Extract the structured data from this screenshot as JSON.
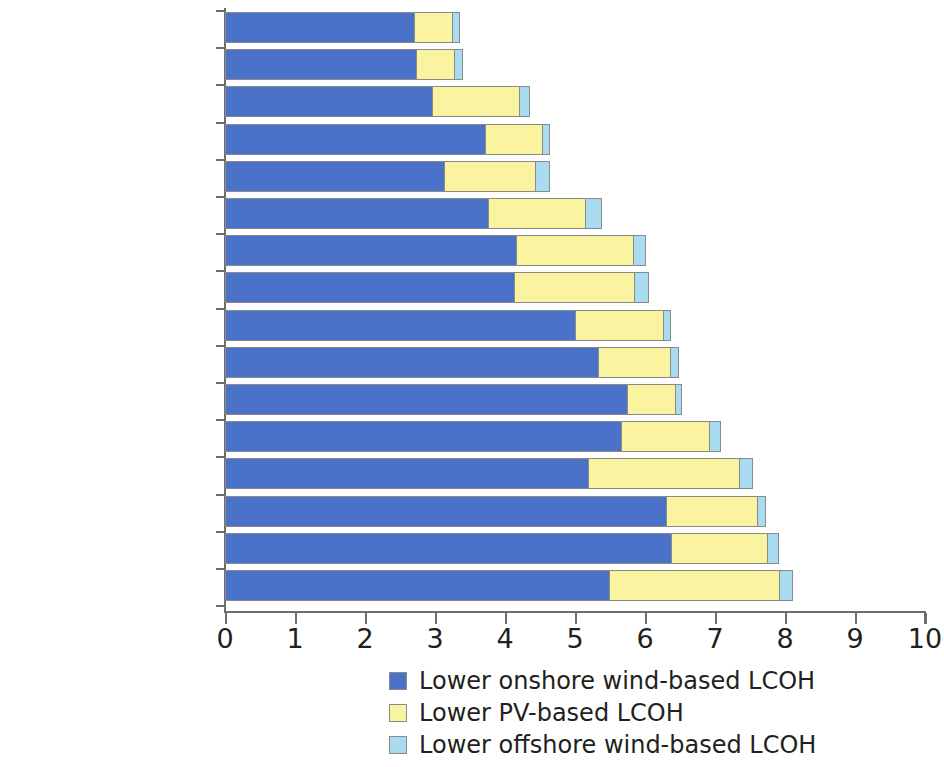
{
  "chart_data": {
    "type": "bar",
    "orientation": "horizontal",
    "stacked": true,
    "title": "",
    "subtitle": "",
    "xlabel": "",
    "ylabel": "",
    "xlim": [
      0,
      10
    ],
    "xticks": [
      "0",
      "1",
      "2",
      "3",
      "4",
      "5",
      "6",
      "7",
      "8",
      "9",
      "10"
    ],
    "grid": false,
    "legend_position": "bottom",
    "categories": [
      "Colombia",
      "Chile",
      "Mexico",
      "Brazil",
      "Peru",
      "Guyana",
      "Panama",
      "Dominican Republic",
      "Argentina",
      "Paraguay",
      "Uruguay",
      "Trinidad and Tobago",
      "Costa Rica",
      "Bolivia",
      "Jamaica",
      "El Salvador"
    ],
    "series": [
      {
        "name": "Lower onshore wind-based LCOH",
        "color": "#4a72c8",
        "values": [
          2.71,
          2.74,
          2.97,
          3.73,
          3.14,
          3.77,
          4.17,
          4.14,
          5.01,
          5.34,
          5.76,
          5.67,
          5.2,
          6.31,
          6.38,
          5.5
        ]
      },
      {
        "name": "Lower PV-based LCOH",
        "color": "#faf3a0",
        "values": [
          0.55,
          0.55,
          1.24,
          0.81,
          1.31,
          1.39,
          1.67,
          1.72,
          1.26,
          1.03,
          0.68,
          1.26,
          2.16,
          1.3,
          1.38,
          2.43
        ]
      },
      {
        "name": "Lower offshore wind-based LCOH",
        "color": "#a9dcf0",
        "values": [
          0.1,
          0.11,
          0.15,
          0.1,
          0.19,
          0.23,
          0.17,
          0.2,
          0.1,
          0.12,
          0.09,
          0.16,
          0.18,
          0.12,
          0.15,
          0.18
        ]
      }
    ],
    "totals": [
      3.36,
      3.4,
      4.36,
      4.64,
      4.64,
      5.39,
      6.01,
      6.06,
      6.37,
      6.49,
      6.53,
      7.09,
      7.54,
      7.73,
      7.91,
      8.11
    ]
  },
  "legend": {
    "items": [
      {
        "label": "Lower onshore wind-based LCOH",
        "color": "#4a72c8",
        "swatch_name": "legend-swatch-onshore"
      },
      {
        "label": "Lower PV-based LCOH",
        "color": "#faf3a0",
        "swatch_name": "legend-swatch-pv"
      },
      {
        "label": "Lower offshore wind-based LCOH",
        "color": "#a9dcf0",
        "swatch_name": "legend-swatch-offshore"
      }
    ]
  },
  "colors": {
    "onshore": "#4a72c8",
    "pv": "#faf3a0",
    "offshore": "#a9dcf0",
    "axis": "#6d6e71",
    "text": "#231f20",
    "background": "#ffffff"
  }
}
